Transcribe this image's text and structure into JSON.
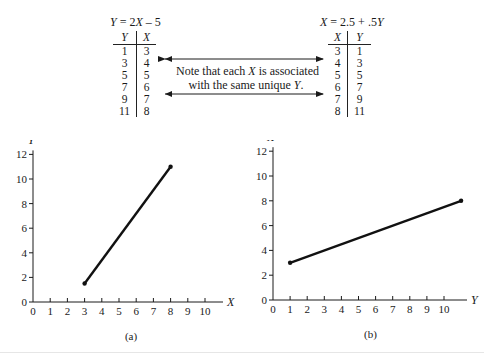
{
  "top": {
    "left_table": {
      "equation_parts": [
        "Y",
        " = 2",
        "X",
        " – 5"
      ],
      "headers": [
        "Y",
        "X"
      ],
      "rows": [
        [
          "1",
          "3"
        ],
        [
          "3",
          "4"
        ],
        [
          "5",
          "5"
        ],
        [
          "7",
          "6"
        ],
        [
          "9",
          "7"
        ],
        [
          "11",
          "8"
        ]
      ]
    },
    "right_table": {
      "equation_parts": [
        "X",
        " = 2.5 + .5",
        "Y"
      ],
      "headers": [
        "X",
        "Y"
      ],
      "rows": [
        [
          "3",
          "1"
        ],
        [
          "4",
          "3"
        ],
        [
          "5",
          "5"
        ],
        [
          "6",
          "7"
        ],
        [
          "7",
          "9"
        ],
        [
          "8",
          "11"
        ]
      ]
    },
    "note": {
      "line1_a": "Note that each ",
      "line1_var": "X",
      "line1_b": " is associated",
      "line2_a": "with the same unique ",
      "line2_var": "Y",
      "line2_b": "."
    }
  },
  "chart_data": [
    {
      "type": "line",
      "title": "",
      "caption": "(a)",
      "xlabel": "X",
      "ylabel": "Y",
      "x_ticks": [
        "0",
        "1",
        "2",
        "3",
        "4",
        "5",
        "6",
        "7",
        "8",
        "9",
        "10"
      ],
      "y_ticks": [
        "0",
        "2",
        "4",
        "6",
        "8",
        "10",
        "12"
      ],
      "xlim": [
        0,
        11
      ],
      "ylim": [
        0,
        12
      ],
      "grid": false,
      "series": [
        {
          "name": "Y = 2X - 5",
          "x": [
            3,
            8
          ],
          "y": [
            1.5,
            11
          ]
        }
      ],
      "points": [
        [
          3,
          1.5
        ],
        [
          8,
          11
        ]
      ]
    },
    {
      "type": "line",
      "title": "",
      "caption": "(b)",
      "xlabel": "Y",
      "ylabel": "X",
      "x_ticks": [
        "0",
        "1",
        "2",
        "3",
        "4",
        "5",
        "6",
        "7",
        "8",
        "9",
        "10"
      ],
      "y_ticks": [
        "0",
        "2",
        "4",
        "6",
        "8",
        "10",
        "12"
      ],
      "xlim": [
        0,
        11
      ],
      "ylim": [
        0,
        12
      ],
      "grid": false,
      "series": [
        {
          "name": "X = 2.5 + .5Y",
          "x": [
            1,
            11
          ],
          "y": [
            3,
            8
          ]
        }
      ],
      "points": [
        [
          1,
          3
        ],
        [
          11,
          8
        ]
      ]
    }
  ]
}
